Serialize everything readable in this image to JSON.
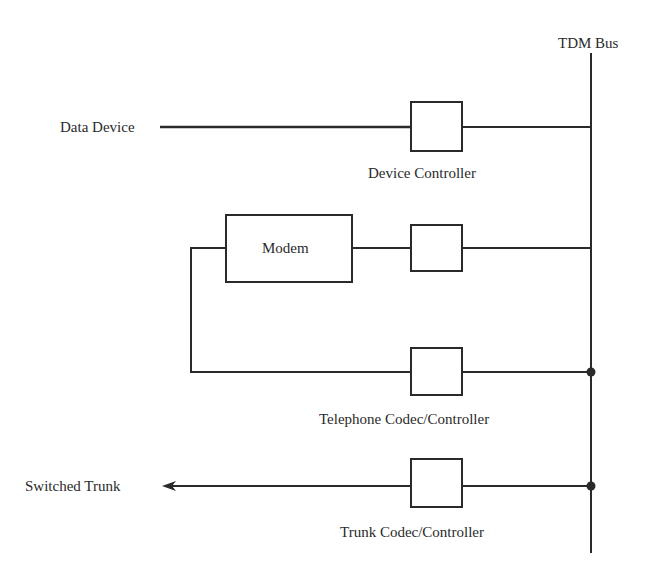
{
  "diagram": {
    "bus": {
      "label": "TDM Bus"
    },
    "endpoints": {
      "data_device": "Data Device",
      "switched_trunk": "Switched Trunk"
    },
    "blocks": {
      "modem": "Modem",
      "device_controller": "Device Controller",
      "telephone_codec": "Telephone Codec/Controller",
      "trunk_codec": "Trunk Codec/Controller"
    },
    "colors": {
      "line": "#2a2a2a",
      "background": "#ffffff"
    }
  }
}
